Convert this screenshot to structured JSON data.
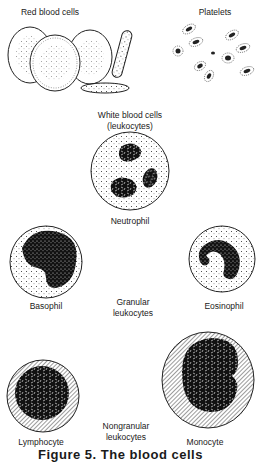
{
  "figure": {
    "labels": {
      "red_blood_cells": "Red blood cells",
      "platelets": "Platelets",
      "white_blood_cells_line1": "White blood cells",
      "white_blood_cells_line2": "(leukocytes)",
      "neutrophil": "Neutrophil",
      "basophil": "Basophil",
      "eosinophil": "Eosinophil",
      "granular_line1": "Granular",
      "granular_line2": "leukocytes",
      "lymphocyte": "Lymphocyte",
      "monocyte": "Monocyte",
      "nongranular_line1": "Nongranular",
      "nongranular_line2": "leukocytes"
    },
    "caption": "Figure 5. The blood cells",
    "colors": {
      "ink": "#1a1a1a",
      "paper": "#ffffff"
    }
  }
}
